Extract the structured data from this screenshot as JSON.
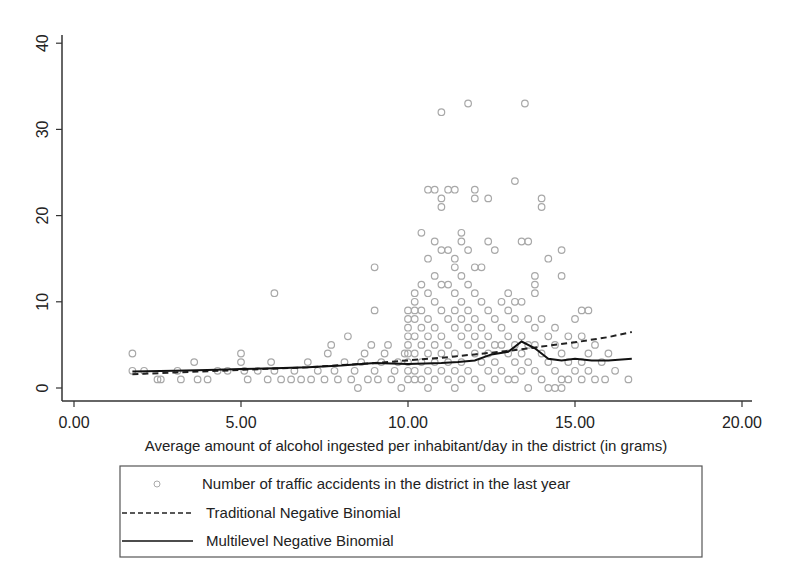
{
  "chart_data": {
    "type": "scatter",
    "title": "",
    "xlabel": "Average amount of alcohol ingested per inhabitant/day in the district (in grams)",
    "ylabel": "",
    "xlim": [
      0,
      20
    ],
    "ylim": [
      0,
      40
    ],
    "xticks": [
      "0.00",
      "5.00",
      "10.00",
      "15.00",
      "20.00"
    ],
    "yticks": [
      "0",
      "10",
      "20",
      "30",
      "40"
    ],
    "grid": false,
    "legend_position": "bottom",
    "legend": [
      {
        "label": "Number of traffic accidents in the district in the last year",
        "style": "hollow-circle",
        "color": "#aaaaaa"
      },
      {
        "label": "Traditional Negative Binomial",
        "style": "dashed",
        "color": "#222222"
      },
      {
        "label": "Multilevel Negative Binomial",
        "style": "solid",
        "color": "#111111"
      }
    ],
    "series": [
      {
        "name": "Number of traffic accidents in the district in the last year",
        "kind": "scatter",
        "points": [
          [
            1.75,
            4
          ],
          [
            1.75,
            2
          ],
          [
            2.1,
            2
          ],
          [
            2.5,
            1
          ],
          [
            2.6,
            1
          ],
          [
            3.1,
            2
          ],
          [
            3.2,
            1
          ],
          [
            3.6,
            3
          ],
          [
            3.7,
            1
          ],
          [
            4.0,
            1
          ],
          [
            4.3,
            2
          ],
          [
            4.6,
            2
          ],
          [
            5.0,
            4
          ],
          [
            5.0,
            3
          ],
          [
            5.1,
            2
          ],
          [
            5.2,
            1
          ],
          [
            5.5,
            2
          ],
          [
            5.8,
            1
          ],
          [
            5.9,
            3
          ],
          [
            6.0,
            11
          ],
          [
            6.0,
            2
          ],
          [
            6.2,
            1
          ],
          [
            6.5,
            1
          ],
          [
            6.6,
            2
          ],
          [
            6.8,
            1
          ],
          [
            7.0,
            3
          ],
          [
            7.1,
            1
          ],
          [
            7.3,
            2
          ],
          [
            7.5,
            1
          ],
          [
            7.6,
            4
          ],
          [
            7.7,
            5
          ],
          [
            7.8,
            2
          ],
          [
            7.9,
            1
          ],
          [
            8.1,
            3
          ],
          [
            8.2,
            6
          ],
          [
            8.3,
            1
          ],
          [
            8.4,
            2
          ],
          [
            8.5,
            0
          ],
          [
            8.6,
            3
          ],
          [
            8.7,
            4
          ],
          [
            8.8,
            1
          ],
          [
            8.9,
            5
          ],
          [
            9.0,
            14
          ],
          [
            9.0,
            9
          ],
          [
            9.0,
            2
          ],
          [
            9.1,
            1
          ],
          [
            9.2,
            3
          ],
          [
            9.3,
            4
          ],
          [
            9.4,
            5
          ],
          [
            9.5,
            1
          ],
          [
            9.6,
            2
          ],
          [
            9.7,
            3
          ],
          [
            9.8,
            0
          ],
          [
            9.9,
            4
          ],
          [
            10.0,
            9
          ],
          [
            10.0,
            8
          ],
          [
            10.0,
            7
          ],
          [
            10.0,
            6
          ],
          [
            10.0,
            5
          ],
          [
            10.0,
            4
          ],
          [
            10.0,
            3
          ],
          [
            10.0,
            2
          ],
          [
            10.0,
            1
          ],
          [
            10.2,
            11
          ],
          [
            10.2,
            10
          ],
          [
            10.2,
            9
          ],
          [
            10.2,
            8
          ],
          [
            10.2,
            6
          ],
          [
            10.2,
            4
          ],
          [
            10.2,
            2
          ],
          [
            10.2,
            1
          ],
          [
            10.4,
            18
          ],
          [
            10.4,
            12
          ],
          [
            10.4,
            9
          ],
          [
            10.4,
            7
          ],
          [
            10.4,
            5
          ],
          [
            10.4,
            3
          ],
          [
            10.4,
            1
          ],
          [
            10.6,
            23
          ],
          [
            10.6,
            15
          ],
          [
            10.6,
            11
          ],
          [
            10.6,
            8
          ],
          [
            10.6,
            6
          ],
          [
            10.6,
            4
          ],
          [
            10.6,
            2
          ],
          [
            10.6,
            0
          ],
          [
            10.8,
            23
          ],
          [
            10.8,
            17
          ],
          [
            10.8,
            13
          ],
          [
            10.8,
            10
          ],
          [
            10.8,
            7
          ],
          [
            10.8,
            5
          ],
          [
            10.8,
            3
          ],
          [
            10.8,
            1
          ],
          [
            11.0,
            32
          ],
          [
            11.0,
            22
          ],
          [
            11.0,
            21
          ],
          [
            11.0,
            16
          ],
          [
            11.0,
            12
          ],
          [
            11.0,
            9
          ],
          [
            11.0,
            6
          ],
          [
            11.0,
            4
          ],
          [
            11.0,
            2
          ],
          [
            11.2,
            23
          ],
          [
            11.2,
            16
          ],
          [
            11.2,
            12
          ],
          [
            11.2,
            8
          ],
          [
            11.2,
            5
          ],
          [
            11.2,
            3
          ],
          [
            11.2,
            1
          ],
          [
            11.4,
            23
          ],
          [
            11.4,
            15
          ],
          [
            11.4,
            14
          ],
          [
            11.4,
            11
          ],
          [
            11.4,
            9
          ],
          [
            11.4,
            7
          ],
          [
            11.4,
            4
          ],
          [
            11.4,
            2
          ],
          [
            11.4,
            0
          ],
          [
            11.6,
            18
          ],
          [
            11.6,
            17
          ],
          [
            11.6,
            13
          ],
          [
            11.6,
            10
          ],
          [
            11.6,
            8
          ],
          [
            11.6,
            6
          ],
          [
            11.6,
            3
          ],
          [
            11.6,
            1
          ],
          [
            11.8,
            33
          ],
          [
            11.8,
            16
          ],
          [
            11.8,
            12
          ],
          [
            11.8,
            9
          ],
          [
            11.8,
            7
          ],
          [
            11.8,
            5
          ],
          [
            11.8,
            2
          ],
          [
            12.0,
            23
          ],
          [
            12.0,
            22
          ],
          [
            12.0,
            14
          ],
          [
            12.0,
            11
          ],
          [
            12.0,
            8
          ],
          [
            12.0,
            6
          ],
          [
            12.0,
            4
          ],
          [
            12.0,
            1
          ],
          [
            12.2,
            14
          ],
          [
            12.2,
            10
          ],
          [
            12.2,
            7
          ],
          [
            12.2,
            5
          ],
          [
            12.2,
            3
          ],
          [
            12.2,
            0
          ],
          [
            12.4,
            22
          ],
          [
            12.4,
            17
          ],
          [
            12.4,
            9
          ],
          [
            12.4,
            6
          ],
          [
            12.4,
            4
          ],
          [
            12.4,
            2
          ],
          [
            12.6,
            16
          ],
          [
            12.6,
            8
          ],
          [
            12.6,
            5
          ],
          [
            12.6,
            3
          ],
          [
            12.6,
            1
          ],
          [
            12.8,
            10
          ],
          [
            12.8,
            7
          ],
          [
            12.8,
            5
          ],
          [
            12.8,
            2
          ],
          [
            13.0,
            11
          ],
          [
            13.0,
            9
          ],
          [
            13.0,
            6
          ],
          [
            13.0,
            4
          ],
          [
            13.0,
            1
          ],
          [
            13.2,
            24
          ],
          [
            13.2,
            10
          ],
          [
            13.2,
            8
          ],
          [
            13.2,
            5
          ],
          [
            13.2,
            3
          ],
          [
            13.2,
            1
          ],
          [
            13.4,
            17
          ],
          [
            13.4,
            10
          ],
          [
            13.4,
            6
          ],
          [
            13.4,
            4
          ],
          [
            13.4,
            2
          ],
          [
            13.5,
            33
          ],
          [
            13.6,
            17
          ],
          [
            13.6,
            8
          ],
          [
            13.6,
            5
          ],
          [
            13.6,
            3
          ],
          [
            13.6,
            0
          ],
          [
            13.8,
            13
          ],
          [
            13.8,
            12
          ],
          [
            13.8,
            11
          ],
          [
            13.8,
            7
          ],
          [
            13.8,
            5
          ],
          [
            13.8,
            2
          ],
          [
            14.0,
            22
          ],
          [
            14.0,
            21
          ],
          [
            14.0,
            8
          ],
          [
            14.0,
            4
          ],
          [
            14.0,
            1
          ],
          [
            14.2,
            15
          ],
          [
            14.2,
            6
          ],
          [
            14.2,
            3
          ],
          [
            14.2,
            0
          ],
          [
            14.4,
            7
          ],
          [
            14.4,
            5
          ],
          [
            14.4,
            2
          ],
          [
            14.4,
            0
          ],
          [
            14.6,
            16
          ],
          [
            14.6,
            13
          ],
          [
            14.6,
            4
          ],
          [
            14.6,
            1
          ],
          [
            14.6,
            0
          ],
          [
            14.8,
            6
          ],
          [
            14.8,
            3
          ],
          [
            14.8,
            1
          ],
          [
            15.0,
            8
          ],
          [
            15.0,
            5
          ],
          [
            15.0,
            2
          ],
          [
            15.2,
            9
          ],
          [
            15.2,
            6
          ],
          [
            15.2,
            3
          ],
          [
            15.2,
            1
          ],
          [
            15.4,
            9
          ],
          [
            15.4,
            4
          ],
          [
            15.4,
            2
          ],
          [
            15.6,
            5
          ],
          [
            15.6,
            1
          ],
          [
            15.8,
            3
          ],
          [
            15.9,
            1
          ],
          [
            16.0,
            4
          ],
          [
            16.2,
            2
          ],
          [
            16.6,
            1
          ]
        ]
      },
      {
        "name": "Traditional Negative Binomial",
        "kind": "line",
        "x": [
          1.75,
          3,
          5,
          7,
          9,
          10,
          11,
          12,
          13,
          14,
          15,
          16,
          16.7
        ],
        "y": [
          1.6,
          1.8,
          2.1,
          2.4,
          2.9,
          3.2,
          3.5,
          3.9,
          4.3,
          4.8,
          5.3,
          5.9,
          6.5
        ]
      },
      {
        "name": "Multilevel Negative Binomial",
        "kind": "line",
        "x": [
          1.75,
          3,
          4,
          5,
          6,
          7,
          8,
          9,
          10,
          11,
          11.5,
          12,
          12.5,
          13,
          13.4,
          13.8,
          14.2,
          14.6,
          15,
          15.5,
          16,
          16.7
        ],
        "y": [
          1.9,
          2.0,
          2.1,
          2.2,
          2.3,
          2.4,
          2.6,
          2.9,
          2.8,
          2.9,
          3.0,
          3.2,
          3.9,
          4.2,
          5.4,
          4.6,
          3.4,
          3.2,
          3.4,
          3.2,
          3.2,
          3.4
        ]
      }
    ]
  }
}
